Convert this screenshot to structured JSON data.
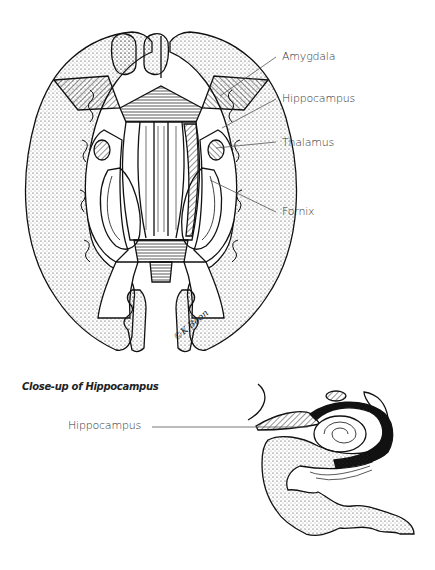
{
  "figure": {
    "top": {
      "title": "Axial section of brain",
      "labels": [
        {
          "text": "Amygdala",
          "x": 282,
          "y": 58
        },
        {
          "text": "Hippocampus",
          "x": 282,
          "y": 100
        },
        {
          "text": "Thalamus",
          "x": 282,
          "y": 144
        },
        {
          "text": "Fornix",
          "x": 282,
          "y": 213
        }
      ],
      "signature": "©K Boon"
    },
    "bottom": {
      "caption": "Close-up of Hippocampus",
      "labels": [
        {
          "text": "Hippocampus",
          "x": 68,
          "y": 423
        }
      ]
    }
  },
  "colors": {
    "ink": "#111111",
    "leader": "#555555",
    "text": "#333333"
  }
}
